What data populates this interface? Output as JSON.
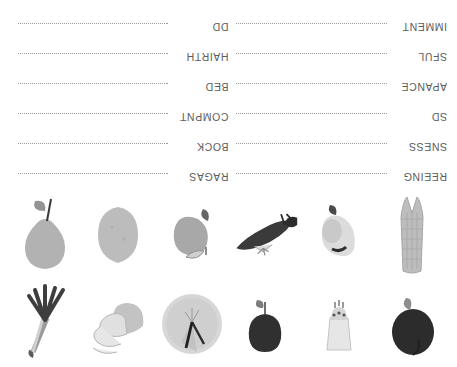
{
  "page": {
    "orientation": "upside-down",
    "background_color": "#ffffff",
    "text_color": "#5d5d5d",
    "line_color": "#9b9b9b"
  },
  "worksheet": {
    "columns": [
      {
        "name": "left-column",
        "rows": [
          {
            "label": "REEING",
            "line": "dotted-writing-line"
          },
          {
            "label": "SNESS",
            "line": "dotted-writing-line"
          },
          {
            "label": "SD",
            "line": "dotted-writing-line"
          },
          {
            "label": "APANCE",
            "line": "dotted-writing-line"
          },
          {
            "label": "SFUL",
            "line": "dotted-writing-line"
          },
          {
            "label": "IMMENT",
            "line": "dotted-writing-line"
          }
        ]
      },
      {
        "name": "right-column",
        "rows": [
          {
            "label": "RAGAS",
            "line": "dotted-writing-line"
          },
          {
            "label": "BOCK",
            "line": "dotted-writing-line"
          },
          {
            "label": "COMPNT",
            "line": "dotted-writing-line"
          },
          {
            "label": "BED",
            "line": "dotted-writing-line"
          },
          {
            "label": "HAIRTH",
            "line": "dotted-writing-line"
          },
          {
            "label": "DD",
            "line": "dotted-writing-line"
          }
        ]
      }
    ]
  },
  "pictures": {
    "row1": [
      {
        "name": "eggplant-illustration",
        "fill": "#2e2e2e"
      },
      {
        "name": "turnip-illustration",
        "fill": "#e0e0e0"
      },
      {
        "name": "tomato-illustration",
        "fill": "#303030"
      },
      {
        "name": "cabbage-illustration",
        "fill": "#d2d2d2"
      },
      {
        "name": "potato-slices-illustration",
        "fill": "#c9c9c9"
      },
      {
        "name": "spring-onion-illustration",
        "fill": "#4a4a4a"
      }
    ],
    "row2": [
      {
        "name": "corn-cob-illustration",
        "fill": "#b9b9b9"
      },
      {
        "name": "garlic-bulb-illustration",
        "fill": "#dcdcdc"
      },
      {
        "name": "chili-pepper-illustration",
        "fill": "#3a3a3a"
      },
      {
        "name": "apple-illustration",
        "fill": "#a8a8a8"
      },
      {
        "name": "potato-illustration",
        "fill": "#bcbcbc"
      },
      {
        "name": "pear-illustration",
        "fill": "#b2b2b2"
      }
    ]
  }
}
